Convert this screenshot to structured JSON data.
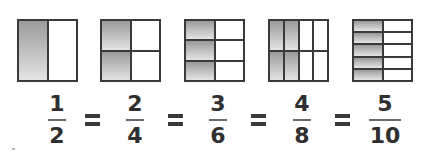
{
  "fractions": [
    {
      "numerator": "1",
      "denominator": "2",
      "grid": {
        "rows": 1,
        "cols": 2
      },
      "shaded_cols": 1,
      "shaded_rows_all": true
    },
    {
      "numerator": "2",
      "denominator": "4",
      "grid": {
        "rows": 2,
        "cols": 2
      },
      "shaded_cols": 1
    },
    {
      "numerator": "3",
      "denominator": "6",
      "grid": {
        "rows": 3,
        "cols": 2
      },
      "shaded_cols": 1
    },
    {
      "numerator": "4",
      "denominator": "8",
      "grid": {
        "rows": 2,
        "cols": 4
      },
      "shaded_cols": 2
    },
    {
      "numerator": "5",
      "denominator": "10",
      "grid": {
        "rows": 5,
        "cols": 2
      },
      "shaded_cols": 1
    }
  ],
  "equals_symbol": "=",
  "colors": {
    "shade_top": "#9a9a9a",
    "shade_bottom": "#e4e4e4",
    "line": "#3a3a3a",
    "text": "#2f2f2f"
  }
}
